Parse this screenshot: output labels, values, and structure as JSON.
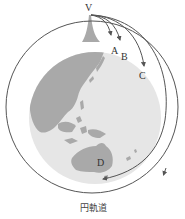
{
  "diagram": {
    "labels": {
      "v": "V",
      "a": "A",
      "b": "B",
      "c": "C",
      "d": "D"
    },
    "caption": "円軌道",
    "colors": {
      "globe": "#e4e4e4",
      "land": "#a9a9a9",
      "orbit_line": "#555555",
      "text": "#333333"
    },
    "elements": {
      "launch_point": "V",
      "trajectories": [
        "A",
        "B",
        "C",
        "D"
      ],
      "orbit": "円軌道"
    }
  }
}
